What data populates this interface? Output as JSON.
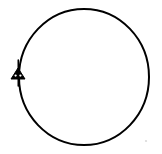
{
  "figure": {
    "title": "Circle with triangular marker",
    "background_color": "#ffffff",
    "stroke_color": "#000000",
    "width": 162,
    "height": 154
  },
  "circle": {
    "name": "circle-outline",
    "center_x": 84,
    "center_y": 77,
    "radius_x": 65,
    "radius_y": 68,
    "stroke_width": 2,
    "fill": "none",
    "stroke_color": "#000000"
  },
  "marker": {
    "name": "triangle-marker",
    "shape": "filled-triangle",
    "center_x": 18,
    "center_y": 75,
    "half_width": 7,
    "top_y": 68,
    "base_y": 79,
    "fill": "#000000",
    "eyes": [
      {
        "cx": 15.6,
        "cy": 75.6,
        "r": 1.15
      },
      {
        "cx": 20.4,
        "cy": 75.6,
        "r": 1.15
      }
    ],
    "stem": {
      "top_y": 60,
      "bottom_y": 86,
      "stroke_width": 1.6
    }
  },
  "speck": {
    "name": "scan-speck",
    "cx": 146,
    "cy": 141,
    "r": 1.1,
    "opacity": 0.28,
    "color": "#777777"
  }
}
